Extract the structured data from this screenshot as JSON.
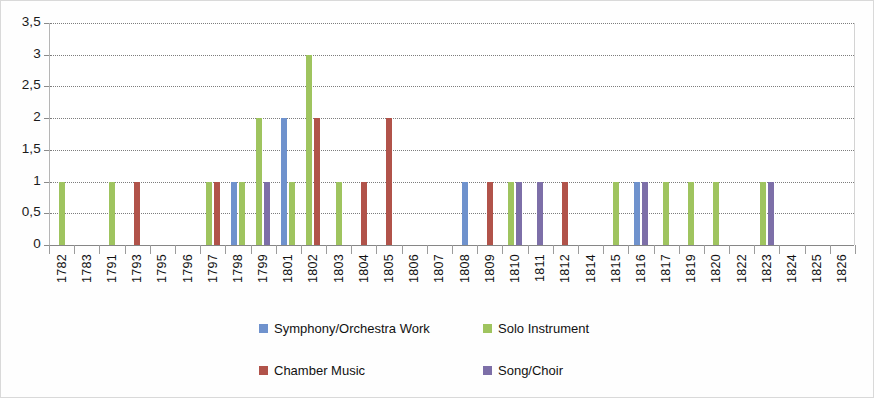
{
  "chart_data": {
    "type": "bar",
    "title": "",
    "subtitle": "",
    "xlabel": "",
    "ylabel": "",
    "ylim": [
      0,
      3.5
    ],
    "ytick_labels": [
      "0",
      "0,5",
      "1",
      "1,5",
      "2",
      "2,5",
      "3",
      "3,5"
    ],
    "ytick_values": [
      0,
      0.5,
      1,
      1.5,
      2,
      2.5,
      3,
      3.5
    ],
    "grid": true,
    "legend_position": "bottom",
    "grouping": "clustered",
    "categories": [
      "1782",
      "1783",
      "1791",
      "1793",
      "1795",
      "1796",
      "1797",
      "1798",
      "1799",
      "1801",
      "1802",
      "1803",
      "1804",
      "1805",
      "1806",
      "1807",
      "1808",
      "1809",
      "1810",
      "1811",
      "1812",
      "1814",
      "1815",
      "1816",
      "1817",
      "1819",
      "1820",
      "1822",
      "1823",
      "1824",
      "1825",
      "1826"
    ],
    "series": [
      {
        "name": "Symphony/Orchestra Work",
        "color": "#6f92cd",
        "values": [
          0,
          0,
          0,
          0,
          0,
          0,
          0,
          1,
          0,
          2,
          0,
          0,
          0,
          0,
          0,
          0,
          1,
          0,
          0,
          0,
          0,
          0,
          0,
          1,
          0,
          0,
          0,
          0,
          0,
          0,
          0,
          0
        ]
      },
      {
        "name": "Solo Instrument",
        "color": "#9fc45f",
        "values": [
          1,
          0,
          1,
          0,
          0,
          0,
          1,
          1,
          2,
          1,
          3,
          1,
          0,
          0,
          0,
          0,
          0,
          0,
          1,
          0,
          0,
          0,
          1,
          0,
          1,
          1,
          1,
          0,
          1,
          0,
          0,
          0
        ]
      },
      {
        "name": "Chamber Music",
        "color": "#b1534a",
        "values": [
          0,
          0,
          0,
          1,
          0,
          0,
          1,
          0,
          0,
          0,
          2,
          0,
          1,
          2,
          0,
          0,
          0,
          1,
          0,
          0,
          1,
          0,
          0,
          0,
          0,
          0,
          0,
          0,
          0,
          0,
          0,
          0
        ]
      },
      {
        "name": "Song/Choir",
        "color": "#7d6fa8",
        "values": [
          0,
          0,
          0,
          0,
          0,
          0,
          0,
          0,
          1,
          0,
          0,
          0,
          0,
          0,
          0,
          0,
          0,
          0,
          1,
          1,
          0,
          0,
          0,
          1,
          0,
          0,
          0,
          0,
          1,
          0,
          0,
          0
        ]
      }
    ]
  },
  "legend": {
    "items": [
      {
        "label": "Symphony/Orchestra Work",
        "color": "#6f92cd"
      },
      {
        "label": "Solo Instrument",
        "color": "#9fc45f"
      },
      {
        "label": "Chamber Music",
        "color": "#b1534a"
      },
      {
        "label": "Song/Choir",
        "color": "#7d6fa8"
      }
    ]
  }
}
